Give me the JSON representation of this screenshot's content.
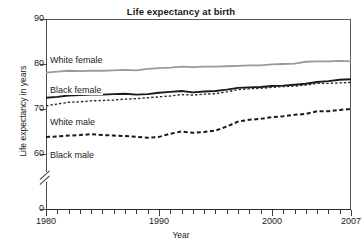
{
  "chart_data": {
    "type": "line",
    "title": "Life expectancy at birth",
    "xlabel": "Year",
    "ylabel": "Life expectancy in years",
    "grid": false,
    "legend_position": "inline-labels",
    "xlim": [
      1980,
      2007
    ],
    "ylim": [
      60,
      90
    ],
    "y_axis_break": true,
    "y_axis_break_note": "axis broken between 0 and 60",
    "ytick_labels": [
      "90",
      "80",
      "70",
      "60",
      "0"
    ],
    "ytick_values": [
      90,
      80,
      70,
      60,
      0
    ],
    "xtick_labels": [
      "1980",
      "1990",
      "2000",
      "2007"
    ],
    "xtick_values": [
      1980,
      1990,
      2000,
      2007
    ],
    "x_minor_tick_interval": 1,
    "x": [
      1980,
      1981,
      1982,
      1983,
      1984,
      1985,
      1986,
      1987,
      1988,
      1989,
      1990,
      1991,
      1992,
      1993,
      1994,
      1995,
      1996,
      1997,
      1998,
      1999,
      2000,
      2001,
      2002,
      2003,
      2004,
      2005,
      2006,
      2007
    ],
    "series": [
      {
        "name": "White female",
        "style": "solid",
        "color": "#9a9a9a",
        "width": 1.8,
        "values": [
          78.1,
          78.3,
          78.5,
          78.4,
          78.5,
          78.5,
          78.6,
          78.7,
          78.6,
          78.9,
          79.1,
          79.2,
          79.4,
          79.3,
          79.4,
          79.4,
          79.5,
          79.6,
          79.7,
          79.7,
          79.9,
          80.0,
          80.1,
          80.5,
          80.6,
          80.6,
          80.7,
          80.6
        ]
      },
      {
        "name": "Black female",
        "style": "solid",
        "color": "#1a1a1a",
        "width": 1.9,
        "values": [
          72.5,
          72.7,
          73.0,
          73.1,
          73.2,
          73.2,
          73.3,
          73.4,
          73.2,
          73.3,
          73.6,
          73.8,
          74.0,
          73.7,
          73.9,
          74.0,
          74.3,
          74.7,
          74.8,
          74.9,
          75.1,
          75.2,
          75.4,
          75.6,
          76.0,
          76.2,
          76.5,
          76.6
        ]
      },
      {
        "name": "White male",
        "style": "fine-dashed",
        "color": "#2a2a2a",
        "width": 1.4,
        "values": [
          70.7,
          71.1,
          71.5,
          71.6,
          71.8,
          71.9,
          72.0,
          72.2,
          72.3,
          72.5,
          72.7,
          72.9,
          73.2,
          73.1,
          73.3,
          73.4,
          73.8,
          74.3,
          74.5,
          74.6,
          74.8,
          75.0,
          75.1,
          75.3,
          75.7,
          75.7,
          75.8,
          75.9
        ]
      },
      {
        "name": "Black male",
        "style": "bold-dashed",
        "color": "#1a1a1a",
        "width": 2.0,
        "values": [
          63.8,
          63.9,
          64.1,
          64.2,
          64.4,
          64.2,
          64.1,
          64.0,
          63.8,
          63.6,
          63.8,
          64.5,
          65.0,
          64.7,
          64.9,
          65.2,
          66.1,
          67.2,
          67.6,
          67.8,
          68.2,
          68.4,
          68.7,
          68.9,
          69.5,
          69.5,
          69.8,
          70.0
        ]
      }
    ]
  },
  "labels": {
    "white_female": "White female",
    "black_female": "Black female",
    "white_male": "White male",
    "black_male": "Black male"
  }
}
